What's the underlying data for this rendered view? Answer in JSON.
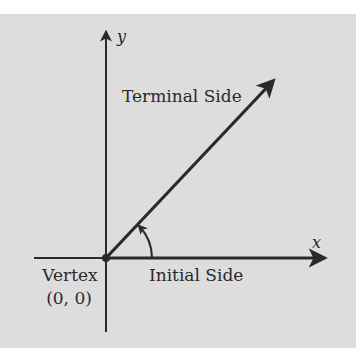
{
  "diagram": {
    "colors": {
      "background": "#dddddd",
      "ink": "#2a2a2a"
    },
    "axes": {
      "x_label": "x",
      "y_label": "y"
    },
    "labels": {
      "terminal_side": "Terminal Side",
      "initial_side": "Initial Side",
      "vertex": "Vertex",
      "vertex_coords": "(0, 0)"
    },
    "angle": {
      "vertex": [
        0,
        0
      ],
      "terminal_direction_deg": 45,
      "rotation": "counterclockwise"
    }
  }
}
